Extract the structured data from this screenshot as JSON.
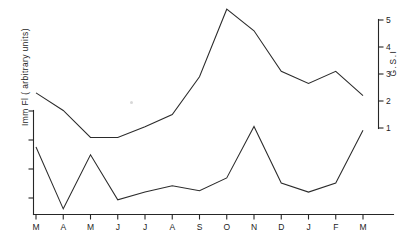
{
  "chart_data": {
    "type": "line",
    "title": "",
    "xlabel": "",
    "ylabel": "Imm Fl ( arbitrary  units)",
    "y2label": "G.S.I",
    "categories": [
      "M",
      "A",
      "M",
      "J",
      "J",
      "A",
      "S",
      "O",
      "N",
      "D",
      "J",
      "F",
      "M"
    ],
    "xtick_labels": [
      "M",
      "A",
      "M",
      "J",
      "J",
      "A",
      "S",
      "O",
      "N",
      "D",
      "J",
      "F",
      "M"
    ],
    "left_axis": {
      "label": "Imm Fl ( arbitrary  units)",
      "tick_labels": [
        "",
        "",
        "",
        ""
      ],
      "ticks_labeled": false,
      "range_note": "arbitrary units, unlabeled ticks"
    },
    "right_axis": {
      "label": "G.S.I",
      "tick_labels": [
        "1",
        "2",
        "3",
        "4",
        "5"
      ],
      "ticks": [
        1,
        2,
        3,
        4,
        5
      ],
      "ylim": [
        1,
        5
      ]
    },
    "grid": false,
    "legend": null,
    "series": [
      {
        "name": "G.S.I",
        "axis": "right",
        "values": [
          2.3,
          1.65,
          0.65,
          0.65,
          1.05,
          1.5,
          2.9,
          5.4,
          4.6,
          3.1,
          2.65,
          3.1,
          2.2
        ]
      },
      {
        "name": "Imm Fl ( arbitrary units)",
        "axis": "left",
        "values": [
          2.6,
          0.2,
          2.3,
          0.55,
          0.85,
          1.1,
          0.9,
          1.4,
          3.4,
          1.2,
          0.85,
          1.2,
          3.25
        ]
      }
    ]
  }
}
